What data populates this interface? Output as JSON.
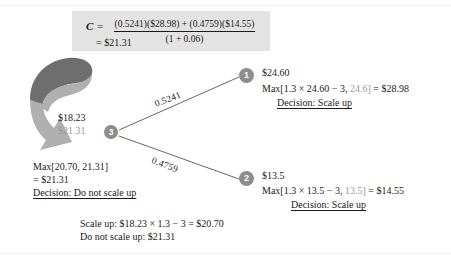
{
  "diagram": {
    "type": "binomial-decision-tree",
    "colors": {
      "node_fill": "#8d8d8d",
      "node_text": "#ffffff",
      "formula_box_bg": "#e3e3e3",
      "edge": "#555555",
      "arrow_dark": "#6e6e6e",
      "arrow_light": "#b0b0b0",
      "text": "#1a1a1a",
      "dim_text": "#9a9a9a"
    },
    "formula": {
      "lhs": "C",
      "equals": "=",
      "numerator": "(0.5241)($28.98) + (0.4759)($14.55)",
      "denominator": "(1 + 0.06)",
      "result": "= $21.31"
    },
    "nodes": [
      {
        "id": "1",
        "label": "1",
        "value": "$24.60"
      },
      {
        "id": "2",
        "label": "2",
        "value": "$13.5"
      },
      {
        "id": "3",
        "label": "3",
        "value": "$18.23",
        "value_alt": "$21.31"
      }
    ],
    "edges": [
      {
        "from": "3",
        "to": "1",
        "probability": "0.5241"
      },
      {
        "from": "3",
        "to": "2",
        "probability": "0.4759"
      }
    ],
    "node_1_annotation": {
      "value": "$24.60",
      "calc_prefix": "Max[1.3 × 24.60 − 3, ",
      "calc_dim": "24.6]",
      "calc_suffix": " = $28.98",
      "decision": "Decision: Scale up"
    },
    "node_2_annotation": {
      "value": "$13.5",
      "calc_prefix": "Max[1.3 × 13.5 − 3, ",
      "calc_dim": "13.5]",
      "calc_suffix": " = $14.55",
      "decision": "Decision: Scale up"
    },
    "node_3_annotation": {
      "value": "$18.23",
      "value_alt": "$21.31",
      "max_line": "Max[20.70, 21.31]",
      "result_line": "= $21.31",
      "decision": "Decision: Do not scale up"
    },
    "footer": {
      "line1": "Scale up: $18.23 × 1.3 − 3 = $20.70",
      "line2": "Do not scale up: $21.31"
    },
    "arrow": {
      "name": "curved-backward-induction-arrow",
      "direction": "counter-clockwise-down-right"
    }
  }
}
